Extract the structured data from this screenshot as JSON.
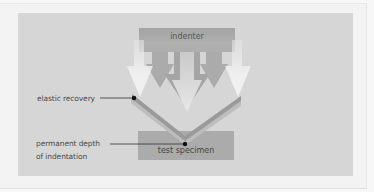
{
  "diagram": {
    "components": {
      "indenter": "indenter",
      "specimen": "test specimen"
    },
    "annotations": {
      "elastic_recovery": "elastic recovery",
      "permanent_depth_line1": "permanent depth",
      "permanent_depth_line2": "of indentation"
    },
    "colors": {
      "background": "#f7f7f7",
      "panel": "#d6d6d6",
      "indenter": "#a9a9a9",
      "specimen": "#ababab",
      "arrow_light": "#eeeeee",
      "v_dark": "#999999",
      "v_light": "#b8b8b8",
      "marker": "#111111"
    }
  }
}
